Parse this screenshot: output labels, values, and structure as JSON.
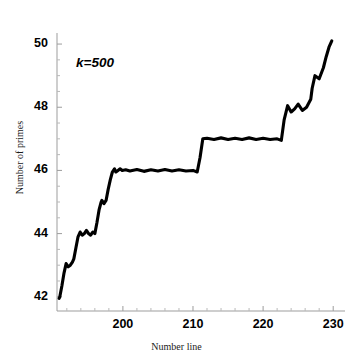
{
  "figure": {
    "background": "#ffffff",
    "line_color": "#000000",
    "axis_color": "#9a9a9a"
  },
  "annotations": [
    {
      "name": "k-label",
      "text": "k=500",
      "x_px": 76,
      "y_px": 55
    }
  ],
  "chart_data": {
    "type": "line",
    "title": "",
    "subtitle": "",
    "xlabel": "Number line",
    "ylabel": "Number of primes",
    "xlim": [
      190.6,
      230.4
    ],
    "ylim": [
      41.55,
      50.35
    ],
    "xticks": [
      200,
      210,
      220,
      230
    ],
    "xtick_labels": [
      "200",
      "210",
      "220",
      "230"
    ],
    "yticks": [
      42,
      44,
      46,
      48,
      50
    ],
    "ytick_labels": [
      "42",
      "44",
      "46",
      "48",
      "50"
    ],
    "x_minor_tick_step": 2,
    "y_minor_tick_step": 0.5,
    "grid": false,
    "legend": null,
    "annotation": "k=500",
    "primes_marked": [
      191,
      193,
      197,
      199,
      211,
      223,
      227,
      229
    ],
    "step_values": [
      {
        "x": 191,
        "y": 42
      },
      {
        "x": 193,
        "y": 43
      },
      {
        "x": 197,
        "y": 44
      },
      {
        "x": 199,
        "y": 45
      },
      {
        "x": 200,
        "y": 46
      },
      {
        "x": 211,
        "y": 47
      },
      {
        "x": 223,
        "y": 48
      },
      {
        "x": 227,
        "y": 49
      },
      {
        "x": 229.8,
        "y": 50.1
      }
    ],
    "series": [
      {
        "name": "pi(x) smoothed, k=500",
        "x": [
          190.9,
          191.0,
          191.3,
          191.6,
          191.9,
          192.2,
          192.5,
          192.8,
          193.0,
          193.3,
          193.6,
          193.9,
          194.2,
          194.5,
          194.8,
          195.1,
          195.4,
          195.7,
          196.0,
          196.3,
          196.6,
          196.9,
          197.0,
          197.3,
          197.6,
          197.9,
          198.2,
          198.5,
          198.8,
          199.0,
          199.3,
          199.6,
          199.9,
          200.4,
          201.0,
          202.0,
          203.0,
          204.0,
          205.0,
          206.0,
          207.0,
          208.0,
          209.0,
          210.0,
          210.6,
          211.0,
          211.4,
          212.0,
          213.0,
          214.0,
          215.0,
          216.0,
          217.0,
          218.0,
          219.0,
          220.0,
          221.0,
          222.0,
          222.6,
          223.0,
          223.5,
          224.0,
          224.5,
          225.0,
          225.6,
          226.2,
          226.8,
          227.0,
          227.4,
          228.0,
          228.6,
          229.0,
          229.4,
          229.8
        ],
        "y": [
          41.95,
          42.0,
          42.35,
          42.75,
          43.05,
          42.95,
          43.0,
          43.1,
          43.2,
          43.55,
          43.9,
          44.05,
          43.95,
          44.0,
          44.1,
          44.0,
          43.95,
          44.05,
          44.0,
          44.35,
          44.75,
          45.0,
          45.05,
          44.95,
          45.05,
          45.4,
          45.7,
          45.95,
          46.05,
          45.95,
          46.0,
          46.05,
          46.0,
          46.02,
          45.98,
          46.03,
          45.97,
          46.02,
          45.98,
          46.03,
          45.98,
          46.02,
          45.98,
          46.0,
          45.95,
          46.4,
          47.0,
          47.02,
          46.98,
          47.03,
          46.98,
          47.02,
          46.98,
          47.03,
          46.98,
          47.02,
          46.98,
          47.0,
          46.95,
          47.6,
          48.05,
          47.85,
          47.95,
          48.1,
          47.9,
          48.0,
          48.25,
          48.6,
          49.0,
          48.9,
          49.25,
          49.6,
          49.9,
          50.1
        ]
      }
    ]
  },
  "axes_pixels": {
    "x0_px": 57,
    "x1_px": 336,
    "y_top_px": 33,
    "y_bottom_px": 311,
    "x_axis_y_px": 311,
    "y_axis_x_px": 57
  }
}
